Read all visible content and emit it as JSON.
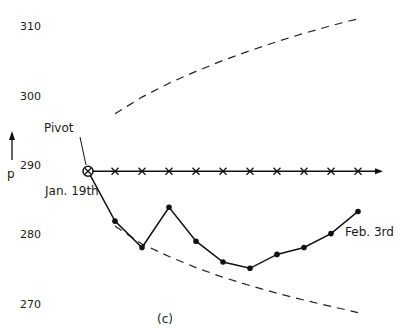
{
  "chart_data": {
    "type": "line",
    "title": "",
    "caption": "(c)",
    "ylabel": "p",
    "xlabel": "",
    "ylim": [
      267,
      312
    ],
    "yticks": [
      310,
      300,
      290,
      280,
      270
    ],
    "ytick_labels": [
      "310",
      "300",
      "290",
      "280",
      "270"
    ],
    "grid": false,
    "x": [
      0,
      1,
      2,
      3,
      4,
      5,
      6,
      7,
      8,
      9,
      10
    ],
    "series": [
      {
        "name": "observed",
        "marker": "dot",
        "values": [
          289.1,
          281.9,
          278.1,
          283.9,
          279.0,
          276.0,
          275.1,
          277.1,
          278.1,
          280.1,
          283.3
        ]
      },
      {
        "name": "pivot-level",
        "marker": "x",
        "values": [
          289.1,
          289.1,
          289.1,
          289.1,
          289.1,
          289.1,
          289.1,
          289.1,
          289.1,
          289.1,
          289.1
        ],
        "arrow": true
      },
      {
        "name": "upper-bound",
        "style": "dashed",
        "x": [
          1,
          2,
          3,
          4,
          5,
          6,
          7,
          8,
          9,
          10
        ],
        "values": [
          297.4,
          299.8,
          301.8,
          303.5,
          305.1,
          306.5,
          307.8,
          309.0,
          310.1,
          311.1
        ]
      },
      {
        "name": "lower-bound",
        "style": "dashed",
        "x": [
          1,
          2,
          3,
          4,
          5,
          6,
          7,
          8,
          9,
          10
        ],
        "values": [
          281.2,
          278.6,
          276.8,
          275.2,
          273.8,
          272.6,
          271.5,
          270.5,
          269.6,
          268.7
        ]
      }
    ],
    "annotations": {
      "pivot": "Pivot",
      "start": "Jan. 19th",
      "end": "Feb. 3rd"
    }
  }
}
